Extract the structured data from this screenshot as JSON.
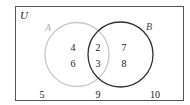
{
  "diagram": {
    "type": "venn",
    "universe": {
      "label": "U",
      "outside_elements": [
        "5",
        "9",
        "10"
      ]
    },
    "sets": [
      {
        "label": "A",
        "only_elements": [
          "4",
          "6"
        ],
        "stroke_color": "#c8c8c8"
      },
      {
        "label": "B",
        "only_elements": [
          "7",
          "8"
        ],
        "stroke_color": "#333333"
      }
    ],
    "intersection": {
      "label": "A∩B",
      "elements": [
        "2",
        "3"
      ]
    },
    "colors": {
      "border": "#555555",
      "text": "#222222",
      "set_a": "#c8c8c8",
      "set_b": "#333333",
      "label_a": "#b0b0b0",
      "label_b": "#444444"
    }
  },
  "labels": {
    "universe": "U",
    "set_a": "A",
    "set_b": "B"
  },
  "elements": {
    "a_only_1": "4",
    "a_only_2": "6",
    "both_1": "2",
    "both_2": "3",
    "b_only_1": "7",
    "b_only_2": "8",
    "outside_1": "5",
    "outside_2": "9",
    "outside_3": "10"
  }
}
